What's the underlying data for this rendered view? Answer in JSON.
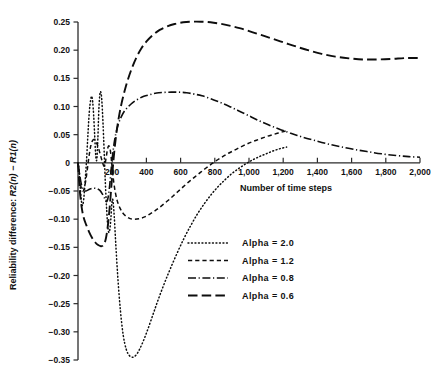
{
  "chart_data": {
    "type": "line",
    "title": "",
    "xlabel": "Number of time steps",
    "ylabel": "Reliability difference: R2(n) − R1(n)",
    "ylabel_parts": {
      "prefix": "Reliability difference: ",
      "sym1": "R",
      "arg1": "2(n)",
      "minus": " − ",
      "sym2": "R",
      "arg2": "1(n)"
    },
    "xlim": [
      0,
      2000
    ],
    "ylim": [
      -0.35,
      0.25
    ],
    "grid": false,
    "legend_position": "lower-right-inside",
    "xticks": [
      0,
      200,
      400,
      600,
      800,
      1000,
      1200,
      1400,
      1600,
      1800,
      2000
    ],
    "xtick_labels": [
      "",
      "200",
      "400",
      "600",
      "800",
      "1,000",
      "1,200",
      "1,400",
      "1,600",
      "1,800",
      "2,000"
    ],
    "yticks": [
      0.25,
      0.2,
      0.15,
      0.1,
      0.05,
      0.0,
      -0.05,
      -0.1,
      -0.15,
      -0.2,
      -0.25,
      -0.3,
      -0.35
    ],
    "ytick_labels": [
      "0.25",
      "0.20",
      "0.15",
      "0.10",
      "0.05",
      "0",
      "−0.05",
      "−0.10",
      "−0.15",
      "−0.20",
      "−0.25",
      "−0.30",
      "−0.35"
    ],
    "series": [
      {
        "name": "Alpha = 2.0",
        "dash": "dotted",
        "legend_label": "Alpha  =  2.0",
        "points": [
          [
            0,
            0.0
          ],
          [
            8,
            -0.02
          ],
          [
            16,
            -0.055
          ],
          [
            24,
            -0.075
          ],
          [
            32,
            -0.068
          ],
          [
            40,
            -0.04
          ],
          [
            50,
            0.005
          ],
          [
            58,
            0.05
          ],
          [
            66,
            0.09
          ],
          [
            74,
            0.112
          ],
          [
            80,
            0.118
          ],
          [
            86,
            0.108
          ],
          [
            92,
            0.082
          ],
          [
            98,
            0.046
          ],
          [
            104,
            0.012
          ],
          [
            110,
            0.006
          ],
          [
            116,
            0.042
          ],
          [
            122,
            0.095
          ],
          [
            128,
            0.122
          ],
          [
            133,
            0.126
          ],
          [
            139,
            0.112
          ],
          [
            146,
            0.072
          ],
          [
            153,
            0.02
          ],
          [
            160,
            -0.036
          ],
          [
            168,
            -0.085
          ],
          [
            176,
            -0.118
          ],
          [
            184,
            -0.122
          ],
          [
            192,
            -0.1
          ],
          [
            198,
            -0.072
          ],
          [
            204,
            -0.066
          ],
          [
            212,
            -0.095
          ],
          [
            222,
            -0.15
          ],
          [
            234,
            -0.208
          ],
          [
            248,
            -0.262
          ],
          [
            264,
            -0.305
          ],
          [
            282,
            -0.331
          ],
          [
            300,
            -0.342
          ],
          [
            320,
            -0.345
          ],
          [
            340,
            -0.341
          ],
          [
            360,
            -0.331
          ],
          [
            385,
            -0.314
          ],
          [
            410,
            -0.294
          ],
          [
            440,
            -0.268
          ],
          [
            470,
            -0.242
          ],
          [
            505,
            -0.214
          ],
          [
            540,
            -0.188
          ],
          [
            580,
            -0.16
          ],
          [
            620,
            -0.134
          ],
          [
            660,
            -0.111
          ],
          [
            700,
            -0.09
          ],
          [
            740,
            -0.072
          ],
          [
            780,
            -0.056
          ],
          [
            820,
            -0.042
          ],
          [
            860,
            -0.03
          ],
          [
            900,
            -0.019
          ],
          [
            940,
            -0.01
          ],
          [
            980,
            -0.002
          ],
          [
            1020,
            0.005
          ],
          [
            1060,
            0.011
          ],
          [
            1100,
            0.016
          ],
          [
            1140,
            0.021
          ],
          [
            1180,
            0.025
          ],
          [
            1220,
            0.028
          ]
        ]
      },
      {
        "name": "Alpha = 1.2",
        "dash": "dashed",
        "legend_label": "Alpha  =  1.2",
        "points": [
          [
            0,
            0.0
          ],
          [
            8,
            -0.018
          ],
          [
            16,
            -0.04
          ],
          [
            26,
            -0.05
          ],
          [
            36,
            -0.046
          ],
          [
            46,
            -0.03
          ],
          [
            56,
            -0.008
          ],
          [
            66,
            0.015
          ],
          [
            76,
            0.032
          ],
          [
            86,
            0.04
          ],
          [
            96,
            0.041
          ],
          [
            108,
            0.036
          ],
          [
            120,
            0.026
          ],
          [
            132,
            0.013
          ],
          [
            144,
            0.0
          ],
          [
            152,
            -0.006
          ],
          [
            158,
            -0.002
          ],
          [
            164,
            0.008
          ],
          [
            170,
            0.02
          ],
          [
            176,
            0.028
          ],
          [
            182,
            0.03
          ],
          [
            188,
            0.024
          ],
          [
            194,
            0.01
          ],
          [
            200,
            -0.01
          ],
          [
            208,
            -0.032
          ],
          [
            218,
            -0.052
          ],
          [
            230,
            -0.068
          ],
          [
            245,
            -0.08
          ],
          [
            262,
            -0.089
          ],
          [
            282,
            -0.095
          ],
          [
            305,
            -0.099
          ],
          [
            330,
            -0.1
          ],
          [
            360,
            -0.099
          ],
          [
            390,
            -0.096
          ],
          [
            420,
            -0.091
          ],
          [
            455,
            -0.084
          ],
          [
            490,
            -0.076
          ],
          [
            530,
            -0.066
          ],
          [
            570,
            -0.055
          ],
          [
            610,
            -0.044
          ],
          [
            655,
            -0.032
          ],
          [
            700,
            -0.021
          ],
          [
            745,
            -0.01
          ],
          [
            790,
            0.0
          ],
          [
            835,
            0.009
          ],
          [
            880,
            0.017
          ],
          [
            925,
            0.024
          ],
          [
            970,
            0.031
          ],
          [
            1015,
            0.037
          ],
          [
            1060,
            0.042
          ],
          [
            1105,
            0.047
          ],
          [
            1150,
            0.051
          ],
          [
            1195,
            0.055
          ],
          [
            1225,
            0.057
          ]
        ]
      },
      {
        "name": "Alpha = 0.8",
        "dash": "dash-dot",
        "legend_label": "Alpha  =  0.8",
        "points": [
          [
            0,
            0.0
          ],
          [
            10,
            -0.022
          ],
          [
            22,
            -0.041
          ],
          [
            34,
            -0.049
          ],
          [
            46,
            -0.05
          ],
          [
            60,
            -0.048
          ],
          [
            76,
            -0.046
          ],
          [
            94,
            -0.045
          ],
          [
            112,
            -0.046
          ],
          [
            128,
            -0.049
          ],
          [
            142,
            -0.055
          ],
          [
            154,
            -0.062
          ],
          [
            163,
            -0.068
          ],
          [
            170,
            -0.068
          ],
          [
            177,
            -0.06
          ],
          [
            184,
            -0.044
          ],
          [
            191,
            -0.022
          ],
          [
            199,
            0.004
          ],
          [
            208,
            0.028
          ],
          [
            220,
            0.05
          ],
          [
            235,
            0.068
          ],
          [
            252,
            0.081
          ],
          [
            272,
            0.092
          ],
          [
            295,
            0.1
          ],
          [
            320,
            0.107
          ],
          [
            350,
            0.113
          ],
          [
            385,
            0.118
          ],
          [
            420,
            0.121
          ],
          [
            460,
            0.124
          ],
          [
            500,
            0.125
          ],
          [
            545,
            0.1255
          ],
          [
            590,
            0.1255
          ],
          [
            635,
            0.1245
          ],
          [
            680,
            0.122
          ],
          [
            725,
            0.119
          ],
          [
            775,
            0.114
          ],
          [
            825,
            0.108
          ],
          [
            880,
            0.101
          ],
          [
            935,
            0.093
          ],
          [
            990,
            0.085
          ],
          [
            1050,
            0.076
          ],
          [
            1110,
            0.068
          ],
          [
            1175,
            0.06
          ],
          [
            1240,
            0.053
          ],
          [
            1310,
            0.046
          ],
          [
            1380,
            0.04
          ],
          [
            1455,
            0.034
          ],
          [
            1530,
            0.029
          ],
          [
            1610,
            0.024
          ],
          [
            1690,
            0.02
          ],
          [
            1775,
            0.016
          ],
          [
            1860,
            0.013
          ],
          [
            1935,
            0.011
          ],
          [
            2000,
            0.01
          ]
        ]
      },
      {
        "name": "Alpha = 0.6",
        "dash": "long-dash",
        "legend_label": "Alpha  =  0.6",
        "points": [
          [
            0,
            0.0
          ],
          [
            10,
            -0.048
          ],
          [
            22,
            -0.08
          ],
          [
            34,
            -0.098
          ],
          [
            48,
            -0.11
          ],
          [
            64,
            -0.122
          ],
          [
            82,
            -0.133
          ],
          [
            100,
            -0.141
          ],
          [
            118,
            -0.146
          ],
          [
            134,
            -0.148
          ],
          [
            146,
            -0.147
          ],
          [
            156,
            -0.142
          ],
          [
            164,
            -0.133
          ],
          [
            171,
            -0.12
          ],
          [
            178,
            -0.102
          ],
          [
            185,
            -0.08
          ],
          [
            192,
            -0.054
          ],
          [
            199,
            -0.026
          ],
          [
            207,
            0.003
          ],
          [
            216,
            0.031
          ],
          [
            227,
            0.058
          ],
          [
            240,
            0.083
          ],
          [
            255,
            0.106
          ],
          [
            272,
            0.127
          ],
          [
            292,
            0.148
          ],
          [
            315,
            0.168
          ],
          [
            340,
            0.186
          ],
          [
            370,
            0.203
          ],
          [
            402,
            0.216
          ],
          [
            438,
            0.227
          ],
          [
            478,
            0.236
          ],
          [
            520,
            0.242
          ],
          [
            565,
            0.2465
          ],
          [
            615,
            0.2495
          ],
          [
            665,
            0.2505
          ],
          [
            720,
            0.2505
          ],
          [
            775,
            0.2495
          ],
          [
            830,
            0.247
          ],
          [
            885,
            0.2435
          ],
          [
            945,
            0.239
          ],
          [
            1005,
            0.2335
          ],
          [
            1070,
            0.227
          ],
          [
            1135,
            0.2205
          ],
          [
            1205,
            0.2135
          ],
          [
            1275,
            0.2065
          ],
          [
            1350,
            0.1995
          ],
          [
            1425,
            0.1935
          ],
          [
            1505,
            0.1885
          ],
          [
            1585,
            0.1855
          ],
          [
            1665,
            0.1835
          ],
          [
            1750,
            0.1835
          ],
          [
            1835,
            0.1845
          ],
          [
            1920,
            0.186
          ],
          [
            2000,
            0.186
          ]
        ]
      }
    ]
  },
  "legend": {
    "entries": [
      {
        "label": "Alpha  =  2.0",
        "dash": "dotted"
      },
      {
        "label": "Alpha  =  1.2",
        "dash": "dashed"
      },
      {
        "label": "Alpha  =  0.8",
        "dash": "dash-dot"
      },
      {
        "label": "Alpha  =  0.6",
        "dash": "long-dash"
      }
    ]
  }
}
